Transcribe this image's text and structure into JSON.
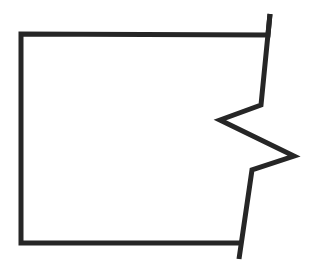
{
  "figure": {
    "canvas": {
      "width": 309,
      "height": 271,
      "background_color": "#ffffff"
    },
    "style": {
      "stroke_color": "#262626",
      "stroke_width": 5,
      "fill": "none",
      "line_cap": "butt",
      "line_join": "miter"
    },
    "paths": [
      {
        "name": "main-outline",
        "points": "270,14 268,35 21,34 21,243 243,243",
        "vertices": [
          {
            "label": "top-tick-top",
            "x": 270,
            "y": 14
          },
          {
            "label": "top-right-corner",
            "x": 268,
            "y": 35
          },
          {
            "label": "top-left-corner",
            "x": 21,
            "y": 34
          },
          {
            "label": "bottom-left-corner",
            "x": 21,
            "y": 243
          },
          {
            "label": "bottom-right-corner",
            "x": 243,
            "y": 243
          }
        ]
      },
      {
        "name": "zigzag-break-line",
        "points": "270,14 261,105 220,120 294,156 252,170 239,259",
        "vertices": [
          {
            "label": "zigzag-start-top",
            "x": 270,
            "y": 14
          },
          {
            "label": "zigzag-upper-elbow",
            "x": 261,
            "y": 105
          },
          {
            "label": "zigzag-left-point",
            "x": 220,
            "y": 120
          },
          {
            "label": "zigzag-right-point",
            "x": 294,
            "y": 156
          },
          {
            "label": "zigzag-lower-elbow",
            "x": 252,
            "y": 170
          },
          {
            "label": "zigzag-end-bottom",
            "x": 239,
            "y": 259
          }
        ]
      }
    ]
  }
}
